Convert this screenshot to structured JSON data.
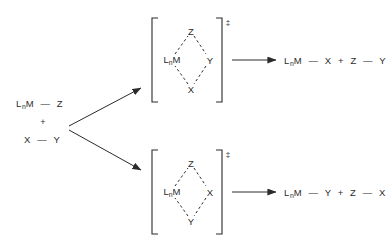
{
  "diagram": {
    "stroke_color": "#2b2b2b",
    "background_color": "#ffffff",
    "reactants": {
      "line1": {
        "metal": "L",
        "metal_sub": "n",
        "metal_tail": "M",
        "bond": "—",
        "partner": "Z"
      },
      "plus": "+",
      "line2": {
        "left": "X",
        "bond": "—",
        "right": "Y"
      }
    },
    "pathways": [
      {
        "id": "upper",
        "transition_state": {
          "dagger": "‡",
          "top": "Z",
          "left_metal": "L",
          "left_metal_sub": "n",
          "left_metal_tail": "M",
          "right": "Y",
          "bottom": "X",
          "bond_style": "dashed"
        },
        "product": {
          "metal": "L",
          "metal_sub": "n",
          "metal_tail": "M",
          "bond1": "—",
          "group1": "X",
          "plus": "+",
          "group2": "Z",
          "bond2": "—",
          "group3": "Y"
        }
      },
      {
        "id": "lower",
        "transition_state": {
          "dagger": "‡",
          "top": "Z",
          "left_metal": "L",
          "left_metal_sub": "n",
          "left_metal_tail": "M",
          "right": "X",
          "bottom": "Y",
          "bond_style": "dashed"
        },
        "product": {
          "metal": "L",
          "metal_sub": "n",
          "metal_tail": "M",
          "bond1": "—",
          "group1": "Y",
          "plus": "+",
          "group2": "Z",
          "bond2": "—",
          "group3": "X"
        }
      }
    ]
  }
}
